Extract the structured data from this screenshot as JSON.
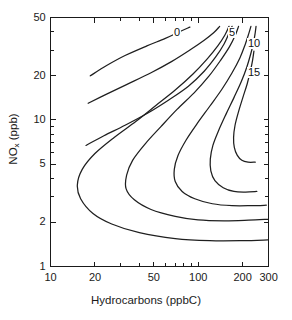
{
  "chart_data": {
    "type": "line",
    "title": "",
    "subtitle": "",
    "xlabel_main": "Hydrocarbons",
    "xlabel_units": "(ppbC)",
    "xlabel": "Hydrocarbons (ppbC)",
    "ylabel_main": "NO",
    "ylabel_sub": "x",
    "ylabel_units": " (ppb)",
    "ylabel": "NOx (ppb)",
    "xscale": "log",
    "yscale": "log",
    "xlim": [
      10,
      300
    ],
    "ylim": [
      1,
      50
    ],
    "grid": false,
    "legend": "none",
    "x_ticks_labeled": [
      "10",
      "20",
      "50",
      "100",
      "200",
      "300"
    ],
    "x_tick_values": [
      10,
      20,
      50,
      100,
      200,
      300
    ],
    "x_minor_tick_values": [
      30,
      40,
      60,
      70,
      80,
      90
    ],
    "y_ticks_labeled": [
      "1",
      "2",
      "5",
      "10",
      "20",
      "50"
    ],
    "y_tick_values": [
      1,
      2,
      5,
      10,
      20,
      50
    ],
    "y_minor_tick_values": [
      3,
      4,
      6,
      7,
      8,
      9,
      30,
      40
    ],
    "contour_levels": [
      0,
      5,
      10,
      15
    ],
    "contour_labels": [
      "0",
      "5",
      "10",
      "15"
    ],
    "series": [
      {
        "name": "0",
        "label": "0",
        "points": [
          [
            18.6,
            20.0
          ],
          [
            24,
            23.5
          ],
          [
            32,
            27.5
          ],
          [
            45,
            32.0
          ],
          [
            60,
            36.0
          ],
          [
            75,
            40.0
          ],
          [
            88,
            43.0
          ]
        ]
      },
      {
        "name": "0-lower",
        "label": "",
        "points": [
          [
            18.0,
            13.0
          ],
          [
            24,
            15.0
          ],
          [
            33,
            17.5
          ],
          [
            48,
            21.0
          ],
          [
            66,
            25.0
          ],
          [
            88,
            30.0
          ],
          [
            110,
            35.0
          ],
          [
            128,
            39.5
          ],
          [
            140,
            43.5
          ]
        ]
      },
      {
        "name": "5",
        "label": "5",
        "points": [
          [
            17.4,
            6.7
          ],
          [
            23,
            7.8
          ],
          [
            32,
            9.2
          ],
          [
            46,
            11.2
          ],
          [
            64,
            13.8
          ],
          [
            86,
            17.0
          ],
          [
            110,
            21.5
          ],
          [
            132,
            27.0
          ],
          [
            150,
            33.0
          ],
          [
            162,
            39.0
          ],
          [
            170,
            43.5
          ]
        ]
      },
      {
        "name": "5-loop",
        "label": "",
        "points": [
          [
            300,
            1.52
          ],
          [
            200,
            1.5
          ],
          [
            120,
            1.5
          ],
          [
            70,
            1.55
          ],
          [
            40,
            1.7
          ],
          [
            26,
            1.95
          ],
          [
            19.4,
            2.3
          ],
          [
            16.0,
            2.9
          ],
          [
            15.2,
            3.6
          ],
          [
            16.4,
            4.6
          ],
          [
            20,
            5.9
          ],
          [
            27,
            7.6
          ],
          [
            38,
            9.8
          ],
          [
            52,
            12.6
          ],
          [
            70,
            16.0
          ],
          [
            92,
            20.5
          ],
          [
            115,
            26.0
          ],
          [
            136,
            32.0
          ],
          [
            152,
            38.0
          ],
          [
            162,
            43.5
          ]
        ]
      },
      {
        "name": "10",
        "label": "10",
        "points": [
          [
            300,
            2.1
          ],
          [
            220,
            2.07
          ],
          [
            150,
            2.05
          ],
          [
            100,
            2.08
          ],
          [
            70,
            2.2
          ],
          [
            48,
            2.45
          ],
          [
            37,
            2.85
          ],
          [
            32.5,
            3.4
          ],
          [
            32.8,
            4.2
          ],
          [
            36,
            5.3
          ],
          [
            44,
            6.9
          ],
          [
            56,
            9.0
          ],
          [
            72,
            11.8
          ],
          [
            94,
            15.3
          ],
          [
            118,
            19.8
          ],
          [
            142,
            25.5
          ],
          [
            163,
            31.5
          ],
          [
            178,
            37.5
          ],
          [
            188,
            43.5
          ]
        ]
      },
      {
        "name": "15",
        "label": "15",
        "points": [
          [
            290,
            2.62
          ],
          [
            230,
            2.6
          ],
          [
            170,
            2.6
          ],
          [
            125,
            2.68
          ],
          [
            95,
            2.9
          ],
          [
            78,
            3.25
          ],
          [
            70,
            3.8
          ],
          [
            69,
            4.6
          ],
          [
            73,
            5.7
          ],
          [
            83,
            7.3
          ],
          [
            99,
            9.5
          ],
          [
            120,
            12.4
          ],
          [
            145,
            16.2
          ],
          [
            170,
            21.0
          ],
          [
            192,
            26.5
          ],
          [
            208,
            32.5
          ],
          [
            220,
            38.5
          ],
          [
            228,
            43.5
          ]
        ]
      },
      {
        "name": "15-inner",
        "label": "",
        "points": [
          [
            250,
            3.25
          ],
          [
            210,
            3.22
          ],
          [
            175,
            3.25
          ],
          [
            148,
            3.45
          ],
          [
            130,
            3.85
          ],
          [
            122,
            4.5
          ],
          [
            121,
            5.4
          ],
          [
            126,
            6.7
          ],
          [
            138,
            8.5
          ],
          [
            155,
            11.0
          ],
          [
            175,
            14.2
          ],
          [
            196,
            18.2
          ],
          [
            214,
            23.0
          ],
          [
            228,
            28.5
          ],
          [
            238,
            34.0
          ],
          [
            244,
            39.5
          ],
          [
            247,
            43.5
          ]
        ]
      },
      {
        "name": "15-core",
        "label": "",
        "points": [
          [
            244,
            5.15
          ],
          [
            218,
            5.15
          ],
          [
            198,
            5.3
          ],
          [
            184,
            5.75
          ],
          [
            176,
            6.5
          ],
          [
            174,
            7.6
          ],
          [
            178,
            9.2
          ],
          [
            188,
            11.4
          ],
          [
            201,
            14.2
          ],
          [
            215,
            17.6
          ],
          [
            226,
            21.5
          ],
          [
            234,
            25.5
          ],
          [
            239,
            29.5
          ]
        ]
      }
    ]
  },
  "axes": {
    "x_label_text": "Hydrocarbons (ppbC)",
    "y_label_main": "NO",
    "y_label_sub": "x",
    "y_label_rest": " (ppb)"
  }
}
